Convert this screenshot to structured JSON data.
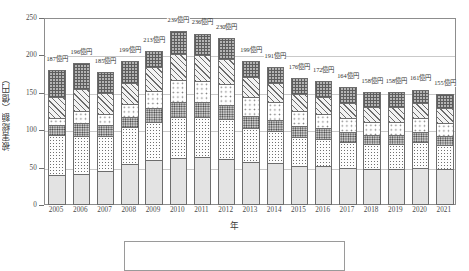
{
  "chart_data": {
    "type": "bar",
    "subtype": "stacked",
    "title": "",
    "xlabel": "年",
    "ylabel": "被害総額（億円）",
    "ylim": [
      0,
      250
    ],
    "yticks": [
      0,
      50,
      100,
      150,
      200,
      250
    ],
    "grid": true,
    "legend_position": "bottom-outside-clipped",
    "unit_suffix": "億円",
    "categories": [
      "2005",
      "2006",
      "2007",
      "2008",
      "2009",
      "2010",
      "2011",
      "2012",
      "2013",
      "2014",
      "2015",
      "2016",
      "2017",
      "2018",
      "2019",
      "2020",
      "2021"
    ],
    "totals": [
      187,
      196,
      185,
      199,
      213,
      239,
      236,
      230,
      199,
      191,
      176,
      172,
      164,
      158,
      158,
      161,
      155
    ],
    "total_labels": [
      "187億円",
      "196億円",
      "185億円",
      "199億円",
      "213億円",
      "239億円",
      "236億円",
      "230億円",
      "199億円",
      "191億円",
      "176億円",
      "172億円",
      "164億円",
      "158億円",
      "158億円",
      "161億円",
      "155億円"
    ],
    "series": [
      {
        "name": "segment-1",
        "pattern": "solid-light-gray",
        "values": [
          40,
          42,
          46,
          55,
          60,
          63,
          64,
          62,
          58,
          56,
          52,
          52,
          50,
          48,
          48,
          50,
          48
        ]
      },
      {
        "name": "segment-2",
        "pattern": "fine-dot",
        "values": [
          55,
          52,
          48,
          50,
          52,
          56,
          55,
          54,
          46,
          44,
          40,
          38,
          36,
          35,
          35,
          36,
          34
        ]
      },
      {
        "name": "segment-3",
        "pattern": "dense-dark-dot",
        "values": [
          15,
          18,
          16,
          16,
          20,
          22,
          21,
          20,
          18,
          17,
          16,
          15,
          14,
          13,
          13,
          14,
          13
        ]
      },
      {
        "name": "segment-4",
        "pattern": "coarse-open-dot",
        "values": [
          10,
          18,
          16,
          18,
          25,
          30,
          30,
          30,
          26,
          25,
          22,
          21,
          20,
          19,
          19,
          20,
          19
        ]
      },
      {
        "name": "segment-5",
        "pattern": "diagonal-hatch",
        "values": [
          30,
          31,
          29,
          30,
          33,
          36,
          36,
          35,
          29,
          27,
          24,
          24,
          22,
          21,
          21,
          22,
          21
        ]
      },
      {
        "name": "segment-6",
        "pattern": "cross-hatch-gray",
        "values": [
          37,
          35,
          30,
          30,
          23,
          32,
          30,
          29,
          22,
          22,
          22,
          22,
          22,
          22,
          22,
          19,
          20
        ]
      }
    ]
  }
}
